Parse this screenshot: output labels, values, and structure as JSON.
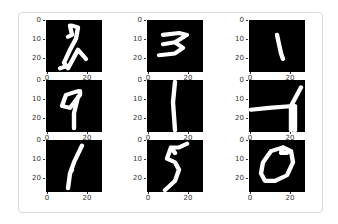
{
  "figure": {
    "layout": {
      "rows": 3,
      "cols": 3
    },
    "colormap": "gray",
    "background": "#000000",
    "stroke": "#ffffff"
  },
  "axes": {
    "yticks": [
      "0",
      "10",
      "20"
    ],
    "xticks": [
      "0",
      "20"
    ]
  },
  "chart_data": {
    "type": "heatmap",
    "title": "",
    "xlabel": "",
    "ylabel": "",
    "xlim": [
      0,
      27
    ],
    "ylim": [
      27,
      0
    ],
    "xticks": [
      0,
      20
    ],
    "yticks": [
      0,
      10,
      20
    ],
    "grid": false,
    "panels": [
      {
        "row": 0,
        "col": 0,
        "digit": "2"
      },
      {
        "row": 0,
        "col": 1,
        "digit": "3"
      },
      {
        "row": 0,
        "col": 2,
        "digit": "1"
      },
      {
        "row": 1,
        "col": 0,
        "digit": "9"
      },
      {
        "row": 1,
        "col": 1,
        "digit": "1"
      },
      {
        "row": 1,
        "col": 2,
        "digit": "4"
      },
      {
        "row": 2,
        "col": 0,
        "digit": "1"
      },
      {
        "row": 2,
        "col": 1,
        "digit": "5"
      },
      {
        "row": 2,
        "col": 2,
        "digit": "0"
      }
    ]
  },
  "strokes": [
    "M 12 3 L 13 8 L 11 9 M 13 3 L 16 4 L 15 10 L 12 16 L 9 23 L 11 26 L 16 16 L 20 21 M 10 25 L 7 26",
    "M 8 8 L 16 7 L 20 8 L 14 12 L 8 13 M 14 12 L 18 15 L 14 18 L 6 19",
    "M 14 8 L 15 13 L 16 18 L 17 21",
    "M 16 6 L 10 8 L 8 14 L 12 15 L 17 8 L 17 6 M 16 9 L 14 18 L 14 26",
    "M 14 1 L 13 12 L 14 27",
    "M 1 16 L 10 15 L 22 14 M 21 27 L 21 14 L 24 8 L 26 4 M 23 27 L 23 14",
    "M 18 3 L 14 12 L 12 18 L 11 26 M 13 16 L 12 18",
    "M 20 2 L 16 4 L 12 4 L 10 10 L 14 12 L 16 16 L 14 22 L 9 27 M 12 4 L 14 7",
    "M 17 4 L 11 6 L 7 12 L 6 18 L 8 22 L 13 22 L 19 19 L 22 12 L 21 6 L 17 4 L 16 7 L 19 7"
  ]
}
